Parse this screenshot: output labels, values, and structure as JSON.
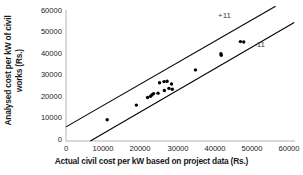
{
  "chart_data": {
    "type": "scatter",
    "title": "",
    "xlabel": "Actual civil cost per kW based on project data (Rs.)",
    "ylabel": "Analysed cost per kW of civil works (Rs.)",
    "ylabel_line1": "Analysed cost per kW of civil",
    "ylabel_line2": "works (Rs.)",
    "xlim": [
      0,
      60000
    ],
    "ylim": [
      0,
      60000
    ],
    "xticks": [
      "0",
      "10000",
      "20000",
      "30000",
      "40000",
      "50000",
      "60000"
    ],
    "yticks": [
      "0",
      "10000",
      "20000",
      "30000",
      "40000",
      "50000",
      "60000"
    ],
    "xtick_values": [
      0,
      10000,
      20000,
      30000,
      40000,
      50000,
      60000
    ],
    "ytick_values": [
      0,
      10000,
      20000,
      30000,
      40000,
      50000,
      60000
    ],
    "grid": false,
    "legend": null,
    "marker": "filled-circle",
    "marker_color": "#000000",
    "points": [
      {
        "x": 11000,
        "y": 9800
      },
      {
        "x": 18800,
        "y": 16500
      },
      {
        "x": 21800,
        "y": 20000
      },
      {
        "x": 22600,
        "y": 20600
      },
      {
        "x": 23000,
        "y": 21300
      },
      {
        "x": 23400,
        "y": 21800
      },
      {
        "x": 24600,
        "y": 22000
      },
      {
        "x": 25000,
        "y": 26800
      },
      {
        "x": 26200,
        "y": 27300
      },
      {
        "x": 26300,
        "y": 23200
      },
      {
        "x": 27000,
        "y": 27500
      },
      {
        "x": 27500,
        "y": 24200
      },
      {
        "x": 28200,
        "y": 26200
      },
      {
        "x": 28400,
        "y": 23800
      },
      {
        "x": 34600,
        "y": 32700
      },
      {
        "x": 41400,
        "y": 40100
      },
      {
        "x": 41500,
        "y": 39400
      },
      {
        "x": 46600,
        "y": 45700
      },
      {
        "x": 47500,
        "y": 45500
      }
    ],
    "reference_lines": [
      {
        "label": "+11",
        "description": "upper bound line",
        "x_start": 0,
        "y_start": 6500,
        "x_end": 56000,
        "y_end": 62000,
        "color": "#000000"
      },
      {
        "label": "-11",
        "description": "lower bound line",
        "x_start": 6500,
        "y_start": 0,
        "x_end": 61000,
        "y_end": 54500,
        "color": "#000000"
      }
    ],
    "annotations": [
      {
        "text": "+11",
        "x": 44000,
        "y": 53500
      },
      {
        "text": "-11",
        "x": 53000,
        "y": 43500
      }
    ]
  }
}
